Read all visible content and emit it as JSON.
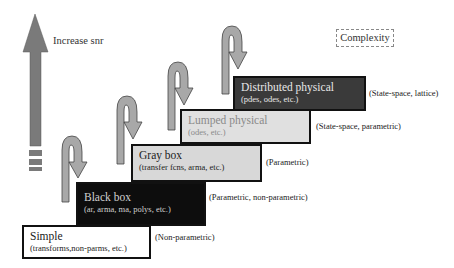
{
  "diagram": {
    "axis_label": "Increase snr",
    "legend_label": "Complexity",
    "colors": {
      "big_arrow": "#7a7a7a",
      "hook_arrow_fill": "#a8a8a8",
      "hook_arrow_stroke": "#444444",
      "simple_fill": "#ffffff",
      "black_box_fill": "#0d0d0d",
      "gray_box_fill": "#d8d8d8",
      "lumped_fill": "#e0e0e0",
      "distributed_fill": "#3a3a3a"
    },
    "steps": [
      {
        "title": "Simple",
        "subtitle": "(transforms,non-parms, etc.)",
        "annotation": "(Non-parametric)"
      },
      {
        "title": "Black box",
        "subtitle": "(ar, arma, ma, polys, etc.)",
        "annotation": "(Parametric, non-parametric)"
      },
      {
        "title": "Gray box",
        "subtitle": "(transfer fcns, arma, etc.)",
        "annotation": "(Parametric)"
      },
      {
        "title": "Lumped physical",
        "subtitle": "(odes, etc.)",
        "annotation": "(State-space, parametric)"
      },
      {
        "title": "Distributed physical",
        "subtitle": "(pdes, odes, etc.)",
        "annotation": "(State-space, lattice)"
      }
    ]
  }
}
